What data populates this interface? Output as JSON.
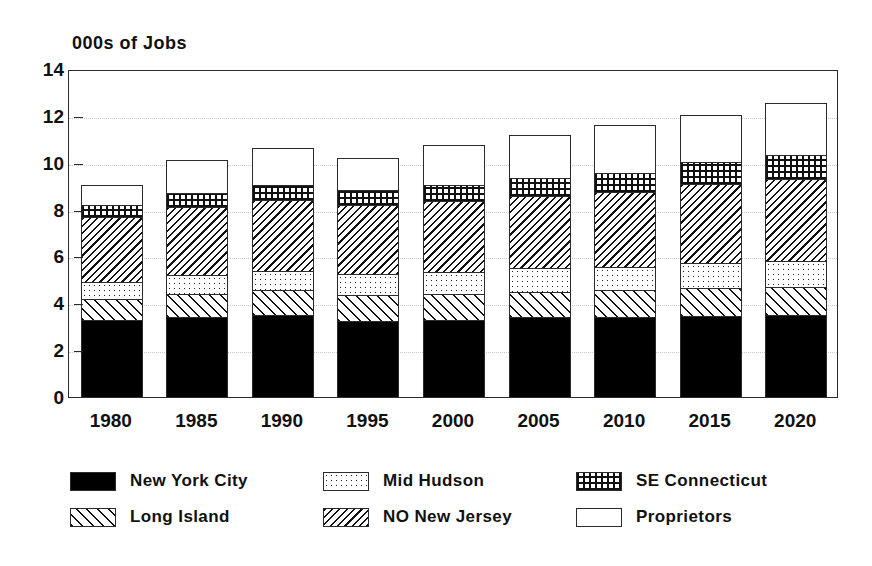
{
  "chart_data": {
    "type": "bar",
    "subtype": "stacked-bar",
    "title": "",
    "ylabel": "000s of Jobs",
    "xlabel": "",
    "ylim": [
      0,
      14
    ],
    "ytick_values": [
      0,
      2,
      4,
      6,
      8,
      10,
      12,
      14
    ],
    "ytick_labels": [
      "0",
      "2",
      "4",
      "6",
      "8",
      "10",
      "12",
      "14"
    ],
    "grid": true,
    "grid_axis": "y",
    "legend_position": "bottom",
    "categories": [
      "1980",
      "1985",
      "1990",
      "1995",
      "2000",
      "2005",
      "2010",
      "2015",
      "2020"
    ],
    "series": [
      {
        "name": "New York City",
        "pattern": "solid-black",
        "color": "#000000",
        "values": [
          3.3,
          3.4,
          3.5,
          3.25,
          3.3,
          3.4,
          3.4,
          3.45,
          3.5
        ]
      },
      {
        "name": "Long Island",
        "pattern": "forward-diagonal-hatch",
        "color": "#ffffff",
        "values": [
          0.9,
          1.0,
          1.05,
          1.1,
          1.1,
          1.1,
          1.15,
          1.2,
          1.2
        ]
      },
      {
        "name": "Mid Hudson",
        "pattern": "stipple-dots",
        "color": "#ffffff",
        "values": [
          0.7,
          0.8,
          0.85,
          0.9,
          0.95,
          1.0,
          1.0,
          1.05,
          1.1
        ]
      },
      {
        "name": "NO New Jersey",
        "pattern": "backward-diagonal-hatch",
        "color": "#ffffff",
        "values": [
          2.8,
          2.9,
          3.0,
          2.95,
          3.0,
          3.1,
          3.2,
          3.4,
          3.5
        ]
      },
      {
        "name": "SE Connecticut",
        "pattern": "grid-dots",
        "color": "#ffffff",
        "values": [
          0.5,
          0.6,
          0.65,
          0.65,
          0.7,
          0.75,
          0.8,
          0.95,
          1.05
        ]
      },
      {
        "name": "Proprietors",
        "pattern": "empty-white",
        "color": "#ffffff",
        "values": [
          0.85,
          1.4,
          1.6,
          1.35,
          1.7,
          1.85,
          2.05,
          2.0,
          2.2
        ]
      }
    ],
    "totals": [
      9.05,
      10.1,
      10.65,
      10.2,
      10.75,
      11.2,
      11.6,
      12.05,
      12.55
    ]
  },
  "legend": {
    "items": [
      {
        "label": "New York City",
        "pattern": "solid-black"
      },
      {
        "label": "Long Island",
        "pattern": "forward-diagonal-hatch"
      },
      {
        "label": "Mid Hudson",
        "pattern": "stipple-dots"
      },
      {
        "label": "NO New Jersey",
        "pattern": "backward-diagonal-hatch"
      },
      {
        "label": "SE Connecticut",
        "pattern": "grid-dots"
      },
      {
        "label": "Proprietors",
        "pattern": "empty-white"
      }
    ]
  }
}
